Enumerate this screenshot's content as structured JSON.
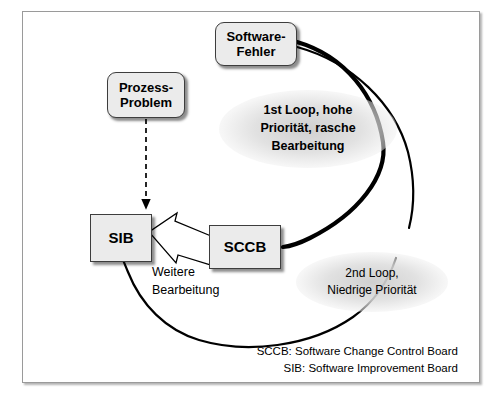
{
  "diagram": {
    "title_nodes": {
      "software_fehler": "Software-\nFehler",
      "prozess_problem": "Prozess-\nProblem",
      "sib": "SIB",
      "sccb": "SCCB"
    },
    "labels": {
      "loop1": "1st Loop, hohe\nPriorität, rasche\nBearbeitung",
      "loop2": "2nd Loop,\nNiedrige Priorität",
      "weitere": "Weitere\nBearbeitung"
    },
    "legend": {
      "line1": "SCCB: Software Change Control Board",
      "line2": "SIB: Software Improvement Board"
    },
    "colors": {
      "node_fill": "#ebebeb",
      "node_border": "#3d3d3d",
      "frame_border": "#9a9a9a",
      "stroke": "#000000",
      "halo": "#d2d2d2",
      "background": "#ffffff"
    }
  }
}
